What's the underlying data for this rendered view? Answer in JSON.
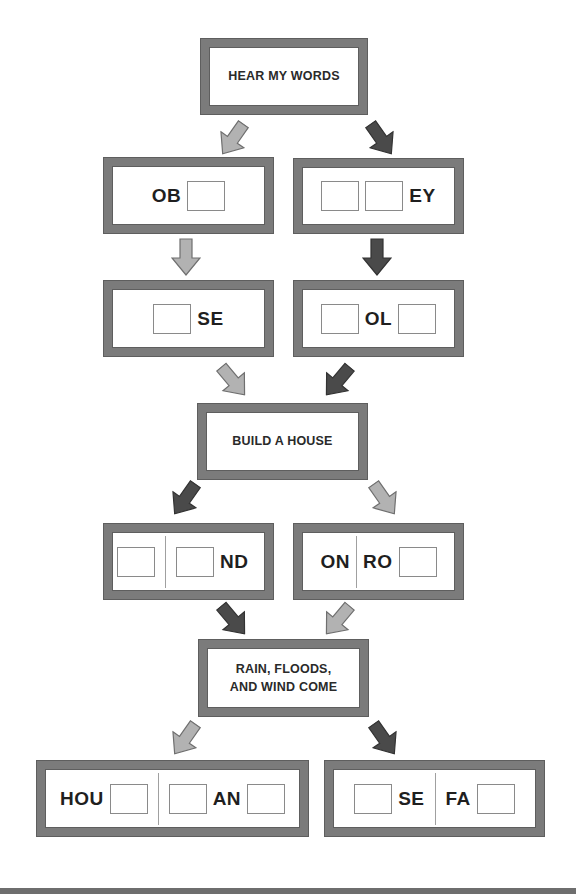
{
  "colors": {
    "box_border": "#7b7b7b",
    "arrow_light": "#b2b2b2",
    "arrow_dark": "#4a4a4a",
    "text": "#1f1f1f"
  },
  "title_boxes": {
    "hear": "HEAR MY WORDS",
    "build": "BUILD A HOUSE",
    "rain_line1": "RAIN, FLOODS,",
    "rain_line2": "AND WIND COME"
  },
  "puzzles": {
    "row1_left": {
      "pre": "OB",
      "blanks": 1
    },
    "row1_right": {
      "post": "EY",
      "blanks": 2
    },
    "row2_left": {
      "post": "SE",
      "blanks": 1
    },
    "row2_right": {
      "mid": "OL",
      "blanks": 2
    },
    "row3_left": {
      "post": "ND",
      "blanks": 2
    },
    "row3_right": {
      "word1": "ON",
      "word2": "RO",
      "blanks": 1
    },
    "row4_left": {
      "word1": "HOU",
      "word2": "AN",
      "blanks": 3
    },
    "row4_right": {
      "word1": "SE",
      "word2": "FA",
      "blanks": 2
    }
  },
  "arrows": [
    {
      "id": "a1",
      "tone": "light",
      "dir": "down-left"
    },
    {
      "id": "a2",
      "tone": "dark",
      "dir": "down-right"
    },
    {
      "id": "a3",
      "tone": "light",
      "dir": "down"
    },
    {
      "id": "a4",
      "tone": "dark",
      "dir": "down"
    },
    {
      "id": "a5",
      "tone": "light",
      "dir": "down-right"
    },
    {
      "id": "a6",
      "tone": "dark",
      "dir": "down-left"
    },
    {
      "id": "a7",
      "tone": "dark",
      "dir": "down-left"
    },
    {
      "id": "a8",
      "tone": "light",
      "dir": "down-right"
    },
    {
      "id": "a9",
      "tone": "dark",
      "dir": "down-right"
    },
    {
      "id": "a10",
      "tone": "light",
      "dir": "down-left"
    },
    {
      "id": "a11",
      "tone": "light",
      "dir": "down-left"
    },
    {
      "id": "a12",
      "tone": "dark",
      "dir": "down-right"
    }
  ]
}
